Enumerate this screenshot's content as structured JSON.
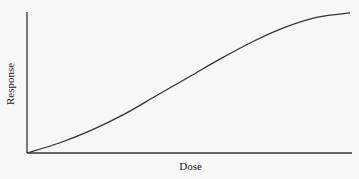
{
  "chart_data": {
    "type": "line",
    "title": "",
    "xlabel": "Dose",
    "ylabel": "Response",
    "grid": false,
    "legend": null,
    "xticks": [],
    "yticks": [],
    "xlim": [
      0,
      1
    ],
    "ylim": [
      0,
      1
    ],
    "series": [
      {
        "name": "dose-response curve",
        "x": [
          0.0,
          0.1,
          0.2,
          0.3,
          0.4,
          0.5,
          0.6,
          0.7,
          0.8,
          0.9,
          1.0
        ],
        "y": [
          0.0,
          0.07,
          0.16,
          0.27,
          0.4,
          0.53,
          0.66,
          0.78,
          0.88,
          0.95,
          0.98
        ]
      }
    ]
  },
  "colors": {
    "axis": "#333333",
    "line": "#333333",
    "background": "#f7f7f7"
  }
}
